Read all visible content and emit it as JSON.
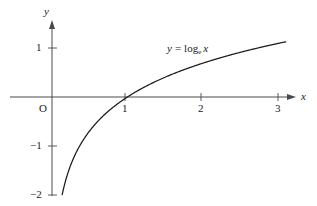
{
  "chart_data": {
    "type": "line",
    "title": "",
    "xlabel": "x",
    "ylabel": "y",
    "xlim": [
      -0.2,
      3.15
    ],
    "ylim": [
      -2.1,
      1.25
    ],
    "grid": false,
    "legend": "inline-annotation",
    "annotations": [
      {
        "text": "y = log_e x",
        "parts": {
          "lhs": "y",
          "operator": "=",
          "func": "log",
          "base": "e",
          "arg": "x"
        },
        "x": 1.55,
        "y": 0.73
      }
    ],
    "series": [
      {
        "name": "y = log_e x",
        "formula": "natural logarithm",
        "color": "#1a1a1a",
        "x_start": 0.135,
        "x_end": 3.1,
        "points": [
          {
            "x": 0.135,
            "y": -2.0
          },
          {
            "x": 0.2,
            "y": -1.609
          },
          {
            "x": 0.3,
            "y": -1.204
          },
          {
            "x": 0.4,
            "y": -0.916
          },
          {
            "x": 0.5,
            "y": -0.693
          },
          {
            "x": 0.7,
            "y": -0.357
          },
          {
            "x": 1.0,
            "y": 0.0
          },
          {
            "x": 1.5,
            "y": 0.405
          },
          {
            "x": 2.0,
            "y": 0.693
          },
          {
            "x": 2.5,
            "y": 0.916
          },
          {
            "x": 3.0,
            "y": 1.099
          },
          {
            "x": 3.1,
            "y": 1.131
          }
        ]
      }
    ],
    "x_ticks": [
      {
        "value": 1,
        "label": "1"
      },
      {
        "value": 2,
        "label": "2"
      },
      {
        "value": 3,
        "label": "3"
      }
    ],
    "y_ticks": [
      {
        "value": 1,
        "label": "1"
      },
      {
        "value": -1,
        "label": "−1"
      },
      {
        "value": -2,
        "label": "−2"
      }
    ],
    "origin_label": "O",
    "axis_color": "#4a4a4a",
    "curve_color": "#1a1a1a",
    "background": "#ffffff"
  },
  "labels": {
    "y_axis_name": "y",
    "x_axis_name": "x",
    "origin": "O",
    "y_tick_1": "1",
    "y_tick_neg1": "−1",
    "y_tick_neg2": "−2",
    "x_tick_1": "1",
    "x_tick_2": "2",
    "x_tick_3": "3",
    "curve_lhs": "y",
    "curve_eq": "=",
    "curve_fn": "log",
    "curve_base": "e",
    "curve_arg": "x"
  }
}
